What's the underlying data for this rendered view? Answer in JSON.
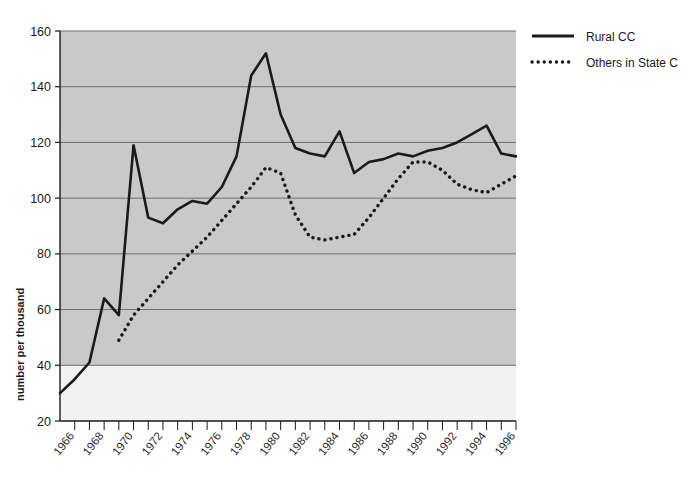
{
  "chart_data": {
    "type": "line",
    "title": "",
    "xlabel": "",
    "ylabel": "number per thousand",
    "xlim": [
      1965,
      1996
    ],
    "ylim": [
      20,
      160
    ],
    "yticks": [
      20,
      40,
      60,
      80,
      100,
      120,
      140,
      160
    ],
    "xticks": [
      1966,
      1968,
      1970,
      1972,
      1974,
      1976,
      1978,
      1980,
      1982,
      1984,
      1986,
      1988,
      1990,
      1992,
      1994,
      1996
    ],
    "xtick_labels": [
      "1966",
      "1968",
      "1970",
      "1972",
      "1974",
      "1976",
      "1978",
      "1980",
      "1982",
      "1984",
      "1986",
      "1988",
      "1990",
      "1992",
      "1994",
      "1996"
    ],
    "ytick_labels": [
      "20",
      "40",
      "60",
      "80",
      "100",
      "120",
      "140",
      "160"
    ],
    "minor_xticks_every": 1,
    "grid": "horizontal",
    "legend_position": "top-right",
    "plot_background": "#c9c9c9",
    "below_40_background": "#f2f2f2",
    "series": [
      {
        "name": "Rural CC",
        "style": "solid",
        "color": "#1a1a1a",
        "x": [
          1965,
          1966,
          1967,
          1968,
          1969,
          1970,
          1971,
          1972,
          1973,
          1974,
          1975,
          1976,
          1977,
          1978,
          1979,
          1980,
          1981,
          1982,
          1983,
          1984,
          1985,
          1986,
          1987,
          1988,
          1989,
          1990,
          1991,
          1992,
          1993,
          1994,
          1995,
          1996
        ],
        "values": [
          30,
          35,
          41,
          64,
          58,
          119,
          93,
          91,
          96,
          99,
          98,
          104,
          115,
          144,
          152,
          130,
          118,
          116,
          115,
          124,
          109,
          113,
          114,
          116,
          115,
          117,
          118,
          120,
          123,
          126,
          116,
          115
        ]
      },
      {
        "name": "Others in State C",
        "style": "dotted",
        "color": "#1a1a1a",
        "x": [
          1969,
          1970,
          1971,
          1972,
          1973,
          1974,
          1975,
          1976,
          1977,
          1978,
          1979,
          1980,
          1981,
          1982,
          1983,
          1984,
          1985,
          1986,
          1987,
          1988,
          1989,
          1990,
          1991,
          1992,
          1993,
          1994,
          1995,
          1996
        ],
        "values": [
          49,
          58,
          64,
          70,
          76,
          81,
          86,
          92,
          98,
          104,
          111,
          109,
          94,
          86,
          85,
          86,
          87,
          93,
          100,
          107,
          113,
          113,
          110,
          105,
          103,
          102,
          105,
          108
        ]
      }
    ],
    "legend": [
      {
        "label": "Rural CC",
        "style": "solid"
      },
      {
        "label": "Others in State C",
        "style": "dotted"
      }
    ]
  }
}
